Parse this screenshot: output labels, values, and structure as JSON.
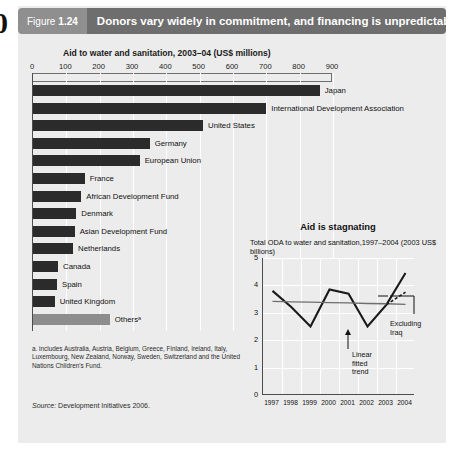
{
  "page_number": "0",
  "header": {
    "figure_label": "Figure",
    "figure_number": "1.24",
    "title": "Donors vary widely in commitment, and financing is unpredictable"
  },
  "footnote": "a. includes Australia, Austria, Belgium, Greece, Finland, Ireland, Italy, Luxembourg, New Zealand, Norway, Sweden, Switzerland and the United Nations Children's Fund.",
  "source_label": "Source:",
  "source_text": "Development Initiatives 2006.",
  "annotations": {
    "excluding_iraq": "Excluding\nIraq",
    "excluding_iraq_line1": "Excluding",
    "excluding_iraq_line2": "Iraq",
    "linear_trend_line1": "Linear",
    "linear_trend_line2": "fitted",
    "linear_trend_line3": "trend"
  },
  "chart_data": [
    {
      "type": "bar",
      "orientation": "horizontal",
      "title": "Aid to water and sanitation, 2003–04 (US$ millions)",
      "xlabel": "",
      "ylabel": "",
      "xlim": [
        0,
        900
      ],
      "xticks": [
        0,
        100,
        200,
        300,
        400,
        500,
        600,
        700,
        800,
        900
      ],
      "grid": true,
      "categories": [
        "Japan",
        "International Development Association",
        "United States",
        "Germany",
        "European Union",
        "France",
        "African Development Fund",
        "Denmark",
        "Asian Development Fund",
        "Netherlands",
        "Canada",
        "Spain",
        "United Kingdom",
        "Othersᵃ"
      ],
      "values": [
        860,
        700,
        510,
        350,
        320,
        155,
        145,
        130,
        125,
        120,
        75,
        72,
        65,
        230
      ],
      "bar_colors": [
        "#2b2b2b",
        "#2b2b2b",
        "#2b2b2b",
        "#2b2b2b",
        "#2b2b2b",
        "#2b2b2b",
        "#2b2b2b",
        "#2b2b2b",
        "#2b2b2b",
        "#2b2b2b",
        "#2b2b2b",
        "#2b2b2b",
        "#2b2b2b",
        "#8d8d8d"
      ]
    },
    {
      "type": "line",
      "title": "Aid is stagnating",
      "subtitle": "Total ODA to water and sanitation,1997–2004 (2003 US$ billions)",
      "xlabel": "",
      "ylabel": "",
      "x": [
        "1997",
        "1998",
        "1999",
        "2000",
        "2001",
        "2002",
        "2003",
        "2004"
      ],
      "ylim": [
        0,
        5
      ],
      "yticks": [
        0,
        1,
        2,
        3,
        4,
        5
      ],
      "grid": true,
      "series": [
        {
          "name": "Total ODA to water and sanitation",
          "values": [
            3.8,
            3.2,
            2.5,
            3.85,
            3.7,
            2.5,
            3.3,
            4.45
          ],
          "color": "#1a1a1a"
        },
        {
          "name": "Linear fitted trend",
          "values": [
            3.42,
            3.4,
            3.39,
            3.37,
            3.36,
            3.34,
            3.33,
            3.31
          ],
          "color": "#6e6e6e"
        },
        {
          "name": "Excluding Iraq",
          "values": [
            null,
            null,
            null,
            null,
            null,
            null,
            3.3,
            3.75
          ],
          "color": "#1a1a1a",
          "style": "dashed"
        }
      ]
    }
  ]
}
